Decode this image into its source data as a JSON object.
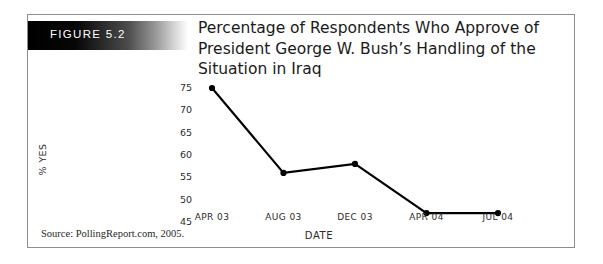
{
  "figure": {
    "banner_label": "FIGURE 5.2",
    "title": "Percentage of Respondents Who Approve of President George W. Bush’s Handling of the Situation in Iraq",
    "source_note": "Source: PollingReport.com, 2005.",
    "banner_gradient_from": "#000000",
    "banner_gradient_to": "#ffffff",
    "frame_border_color": "#8d8d8d",
    "background_color": "#ffffff"
  },
  "chart_data": {
    "type": "line",
    "title": "Percentage of Respondents Who Approve of President George W. Bush’s Handling of the Situation in Iraq",
    "xlabel": "DATE",
    "ylabel": "% YES",
    "categories": [
      "APR 03",
      "AUG 03",
      "DEC 03",
      "APR 04",
      "JUL 04"
    ],
    "values": [
      75,
      56,
      58,
      47,
      47
    ],
    "ylim": [
      45,
      75
    ],
    "yticks": [
      75,
      70,
      65,
      60,
      55,
      50,
      45
    ],
    "grid": false,
    "legend": "none",
    "line_color": "#000000",
    "marker": "circle",
    "marker_color": "#000000",
    "series": [
      {
        "name": "% YES",
        "points": [
          {
            "x": "APR 03",
            "y": 75
          },
          {
            "x": "AUG 03",
            "y": 56
          },
          {
            "x": "DEC 03",
            "y": 58
          },
          {
            "x": "APR 04",
            "y": 47
          },
          {
            "x": "JUL 04",
            "y": 47
          }
        ]
      }
    ]
  }
}
